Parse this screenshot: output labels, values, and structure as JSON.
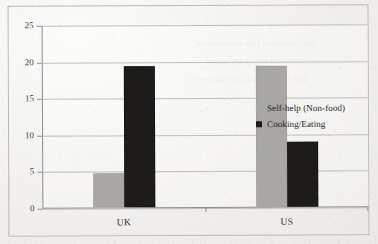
{
  "chart_data": {
    "type": "bar",
    "title": "",
    "subtitle": "",
    "xlabel": "",
    "ylabel": "",
    "categories": [
      "UK",
      "US"
    ],
    "series": [
      {
        "name": "Self-help (Non-food)",
        "color": "#a8a7a4",
        "values": [
          4.7,
          19.3
        ]
      },
      {
        "name": "Cooking/Eating",
        "color": "#1d1c1b",
        "values": [
          19.3,
          8.9
        ]
      }
    ],
    "ylim": [
      0,
      25
    ],
    "ytick_values": [
      0,
      5,
      10,
      15,
      20,
      25
    ],
    "ytick_labels": [
      "0",
      "5",
      "10",
      "15",
      "20",
      "25"
    ],
    "grid": true,
    "grid_axis": "y",
    "legend_position": "right",
    "frame": true
  },
  "legend": {
    "entries": [
      {
        "label": "Self-help (Non-food)",
        "swatch": "legend-swatch-gray"
      },
      {
        "label": "Cooking/Eating",
        "swatch": "legend-swatch-black"
      }
    ]
  },
  "bleed_text": [
    "the results of this comparison",
    "are shown in the chart below",
    "and suggest that consumers in"
  ]
}
